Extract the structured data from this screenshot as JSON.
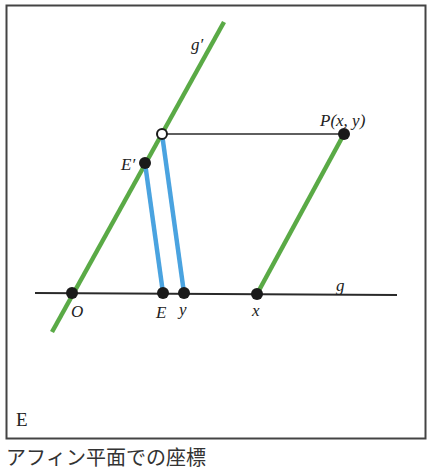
{
  "figure": {
    "panel_label": "E",
    "caption": "アフィン平面での座標",
    "colors": {
      "green_line": "#5aaa46",
      "blue_line": "#4aa3e0",
      "black_line": "#2a2a2a",
      "point": "#1a1a1a",
      "frame": "#444444"
    },
    "lines": [
      {
        "name": "g",
        "label": "g",
        "from": [
          35,
          293
        ],
        "to": [
          397,
          295
        ],
        "color": "black"
      },
      {
        "name": "g-prime",
        "label": "g′",
        "from": [
          52,
          332
        ],
        "to": [
          224,
          22
        ],
        "color": "green"
      },
      {
        "name": "parallel-through-P",
        "from": [
          257,
          294
        ],
        "to": [
          344,
          134
        ],
        "color": "green"
      },
      {
        "name": "horizontal-through-P",
        "from": [
          162,
          134
        ],
        "to": [
          344,
          134
        ],
        "color": "black"
      },
      {
        "name": "E-prime-to-E",
        "from": [
          145,
          163
        ],
        "to": [
          163,
          293
        ],
        "color": "blue"
      },
      {
        "name": "open-point-to-y",
        "from": [
          162,
          134
        ],
        "to": [
          184,
          293
        ],
        "color": "blue"
      }
    ],
    "points": [
      {
        "name": "O",
        "label": "O",
        "pos": [
          72,
          293
        ],
        "filled": true
      },
      {
        "name": "E",
        "label": "E",
        "pos": [
          163,
          293
        ],
        "filled": true
      },
      {
        "name": "y",
        "label": "y",
        "pos": [
          184,
          293
        ],
        "filled": true
      },
      {
        "name": "x",
        "label": "x",
        "pos": [
          257,
          294
        ],
        "filled": true
      },
      {
        "name": "E-prime",
        "label": "E′",
        "pos": [
          145,
          163
        ],
        "filled": true
      },
      {
        "name": "P",
        "label": "P(x, y)",
        "pos": [
          344,
          134
        ],
        "filled": true
      },
      {
        "name": "projection-point",
        "label": "",
        "pos": [
          162,
          134
        ],
        "filled": false
      }
    ],
    "labels": {
      "g_prime": "g′",
      "g": "g",
      "O": "O",
      "E": "E",
      "y": "y",
      "x": "x",
      "E_prime": "E′",
      "P": "P(x, y)"
    }
  }
}
